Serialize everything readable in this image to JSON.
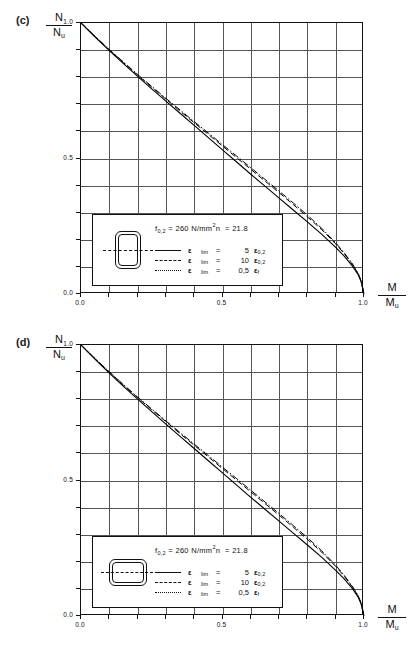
{
  "figure": {
    "panels": [
      {
        "id": "c",
        "label": "(c)",
        "yaxis": {
          "numerator": "N",
          "denominator": "N",
          "denominator_sub": "u"
        },
        "xaxis": {
          "numerator": "M",
          "denominator": "M",
          "denominator_sub": "u"
        },
        "xticks": [
          "0.0",
          "0.5",
          "1.0"
        ],
        "yticks": [
          "1.0",
          "0.5",
          "0.0"
        ],
        "section_shape": "portrait-hollow-rectangle",
        "legend": {
          "material_f_symbol": "f",
          "material_f_sub": "0,2",
          "material_eq": "=",
          "material_value": "260",
          "material_unit": "N/mm",
          "material_unit_sup": "2",
          "n_symbol": "n",
          "n_eq": "=",
          "n_value": "21.8",
          "rows": [
            {
              "style": "solid",
              "eps": "ε",
              "eps_sub": "lim",
              "eq": "=",
              "value": "5",
              "eps2": "ε",
              "eps2_sub": "0,2"
            },
            {
              "style": "dash",
              "eps": "ε",
              "eps_sub": "lim",
              "eq": "=",
              "value": "10",
              "eps2": "ε",
              "eps2_sub": "0,2"
            },
            {
              "style": "dashdot",
              "eps": "ε",
              "eps_sub": "lim",
              "eq": "=",
              "value": "0,5",
              "eps2": "ε",
              "eps2_sub": "f"
            }
          ]
        }
      },
      {
        "id": "d",
        "label": "(d)",
        "yaxis": {
          "numerator": "N",
          "denominator": "N",
          "denominator_sub": "u"
        },
        "xaxis": {
          "numerator": "M",
          "denominator": "M",
          "denominator_sub": "u"
        },
        "xticks": [
          "0.0",
          "0.5",
          "1.0"
        ],
        "yticks": [
          "1.0",
          "0.5",
          "0.0"
        ],
        "section_shape": "landscape-hollow-rectangle",
        "legend": {
          "material_f_symbol": "f",
          "material_f_sub": "0,2",
          "material_eq": "=",
          "material_value": "260",
          "material_unit": "N/mm",
          "material_unit_sup": "2",
          "n_symbol": "n",
          "n_eq": "=",
          "n_value": "21.8",
          "rows": [
            {
              "style": "solid",
              "eps": "ε",
              "eps_sub": "lim",
              "eq": "=",
              "value": "5",
              "eps2": "ε",
              "eps2_sub": "0,2"
            },
            {
              "style": "dash",
              "eps": "ε",
              "eps_sub": "lim",
              "eq": "=",
              "value": "10",
              "eps2": "ε",
              "eps2_sub": "0,2"
            },
            {
              "style": "dashdot",
              "eps": "ε",
              "eps_sub": "lim",
              "eq": "=",
              "value": "0,5",
              "eps2": "ε",
              "eps2_sub": "f"
            }
          ]
        }
      }
    ]
  },
  "chart_data": [
    {
      "type": "line",
      "title": "(c)",
      "xlabel": "M/Mu",
      "ylabel": "N/Nu",
      "xlim": [
        0.0,
        1.0
      ],
      "ylim": [
        0.0,
        1.0
      ],
      "grid": true,
      "grid_divisions": 10,
      "legend_position": "inside-bottom-left",
      "series": [
        {
          "name": "ε_lim = 5 ε_0,2",
          "dash": "solid",
          "x": [
            0.0,
            0.05,
            0.1,
            0.15,
            0.2,
            0.25,
            0.3,
            0.35,
            0.4,
            0.45,
            0.5,
            0.55,
            0.6,
            0.65,
            0.7,
            0.75,
            0.8,
            0.85,
            0.9,
            0.93,
            0.96,
            0.98,
            0.99,
            1.0
          ],
          "y": [
            1.0,
            0.948,
            0.898,
            0.85,
            0.803,
            0.757,
            0.712,
            0.667,
            0.622,
            0.577,
            0.532,
            0.487,
            0.442,
            0.398,
            0.354,
            0.31,
            0.266,
            0.221,
            0.172,
            0.14,
            0.102,
            0.07,
            0.045,
            0.0
          ]
        },
        {
          "name": "ε_lim = 10 ε_0,2",
          "dash": "dashed",
          "x": [
            0.0,
            0.05,
            0.1,
            0.15,
            0.2,
            0.25,
            0.3,
            0.35,
            0.4,
            0.45,
            0.5,
            0.55,
            0.6,
            0.65,
            0.7,
            0.75,
            0.8,
            0.85,
            0.9,
            0.93,
            0.96,
            0.98,
            0.99,
            1.0
          ],
          "y": [
            1.0,
            0.95,
            0.901,
            0.854,
            0.808,
            0.763,
            0.719,
            0.675,
            0.632,
            0.589,
            0.546,
            0.503,
            0.46,
            0.417,
            0.374,
            0.33,
            0.285,
            0.238,
            0.185,
            0.149,
            0.108,
            0.073,
            0.047,
            0.0
          ]
        },
        {
          "name": "ε_lim = 0,5 ε_f",
          "dash": "dashdot",
          "x": [
            0.0,
            0.05,
            0.1,
            0.15,
            0.2,
            0.25,
            0.3,
            0.35,
            0.4,
            0.45,
            0.5,
            0.55,
            0.6,
            0.65,
            0.7,
            0.75,
            0.8,
            0.85,
            0.9,
            0.93,
            0.96,
            0.98,
            0.99,
            1.0
          ],
          "y": [
            1.0,
            0.951,
            0.902,
            0.856,
            0.81,
            0.766,
            0.722,
            0.679,
            0.636,
            0.594,
            0.551,
            0.509,
            0.466,
            0.423,
            0.38,
            0.336,
            0.291,
            0.243,
            0.189,
            0.152,
            0.11,
            0.075,
            0.048,
            0.0
          ]
        }
      ]
    },
    {
      "type": "line",
      "title": "(d)",
      "xlabel": "M/Mu",
      "ylabel": "N/Nu",
      "xlim": [
        0.0,
        1.0
      ],
      "ylim": [
        0.0,
        1.0
      ],
      "grid": true,
      "grid_divisions": 10,
      "legend_position": "inside-bottom-left",
      "series": [
        {
          "name": "ε_lim = 5 ε_0,2",
          "dash": "solid",
          "x": [
            0.0,
            0.05,
            0.1,
            0.15,
            0.2,
            0.25,
            0.3,
            0.35,
            0.4,
            0.45,
            0.5,
            0.55,
            0.6,
            0.65,
            0.7,
            0.75,
            0.8,
            0.85,
            0.9,
            0.93,
            0.96,
            0.98,
            0.99,
            1.0
          ],
          "y": [
            1.0,
            0.947,
            0.896,
            0.847,
            0.8,
            0.754,
            0.708,
            0.663,
            0.618,
            0.573,
            0.528,
            0.483,
            0.438,
            0.394,
            0.35,
            0.306,
            0.262,
            0.217,
            0.168,
            0.137,
            0.1,
            0.068,
            0.044,
            0.0
          ]
        },
        {
          "name": "ε_lim = 10 ε_0,2",
          "dash": "dashed",
          "x": [
            0.0,
            0.05,
            0.1,
            0.15,
            0.2,
            0.25,
            0.3,
            0.35,
            0.4,
            0.45,
            0.5,
            0.55,
            0.6,
            0.65,
            0.7,
            0.75,
            0.8,
            0.85,
            0.9,
            0.93,
            0.96,
            0.98,
            0.99,
            1.0
          ],
          "y": [
            1.0,
            0.949,
            0.9,
            0.852,
            0.806,
            0.761,
            0.717,
            0.673,
            0.63,
            0.587,
            0.544,
            0.501,
            0.458,
            0.415,
            0.372,
            0.328,
            0.283,
            0.236,
            0.183,
            0.147,
            0.106,
            0.072,
            0.046,
            0.0
          ]
        },
        {
          "name": "ε_lim = 0,5 ε_f",
          "dash": "dashdot",
          "x": [
            0.0,
            0.05,
            0.1,
            0.15,
            0.2,
            0.25,
            0.3,
            0.35,
            0.4,
            0.45,
            0.5,
            0.55,
            0.6,
            0.65,
            0.7,
            0.75,
            0.8,
            0.85,
            0.9,
            0.93,
            0.96,
            0.98,
            0.99,
            1.0
          ],
          "y": [
            1.0,
            0.95,
            0.901,
            0.854,
            0.808,
            0.764,
            0.72,
            0.677,
            0.634,
            0.592,
            0.549,
            0.507,
            0.464,
            0.421,
            0.378,
            0.334,
            0.289,
            0.241,
            0.187,
            0.15,
            0.108,
            0.074,
            0.047,
            0.0
          ]
        }
      ]
    }
  ]
}
